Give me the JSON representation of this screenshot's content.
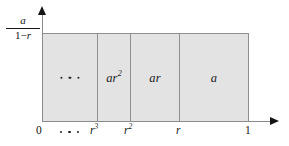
{
  "figure": {
    "type": "geometric-series-area-diagram",
    "y_axis_label": {
      "numerator": "a",
      "denominator_prefix": "1−",
      "denominator_var": "r",
      "full": "a/(1−r)"
    },
    "bars": [
      {
        "name": "tail",
        "label": "",
        "label_sup": "",
        "has_ellipsis": true
      },
      {
        "name": "ar2",
        "label": "ar",
        "label_sup": "2",
        "has_ellipsis": false
      },
      {
        "name": "ar",
        "label": "ar",
        "label_sup": "",
        "has_ellipsis": false
      },
      {
        "name": "a",
        "label": "a",
        "label_sup": "",
        "has_ellipsis": false
      }
    ],
    "x_ticks": [
      {
        "name": "origin",
        "label": "0",
        "sup": "",
        "italic": false
      },
      {
        "name": "r3",
        "label": "r",
        "sup": "3",
        "italic": true
      },
      {
        "name": "r2",
        "label": "r",
        "sup": "2",
        "italic": true
      },
      {
        "name": "r",
        "label": "r",
        "sup": "",
        "italic": true
      },
      {
        "name": "one",
        "label": "1",
        "sup": "",
        "italic": false
      }
    ],
    "colors": {
      "fill": "#e3e3e3",
      "stroke": "#8f8f8f",
      "axis": "#8b8b8b",
      "text": "#141414",
      "background": "#ffffff"
    }
  }
}
